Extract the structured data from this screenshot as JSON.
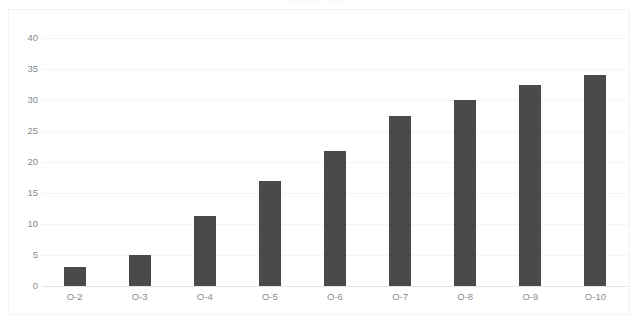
{
  "chart_data": {
    "type": "bar",
    "title": "Chart Title",
    "xlabel": "",
    "ylabel": "",
    "categories": [
      "O-2",
      "O-3",
      "O-4",
      "O-5",
      "O-6",
      "O-7",
      "O-8",
      "O-9",
      "O-10"
    ],
    "values": [
      3,
      5,
      11.3,
      17,
      21.8,
      27.5,
      30,
      32.5,
      34
    ],
    "ylim": [
      0,
      40
    ],
    "yticks": [
      0,
      5,
      10,
      15,
      20,
      25,
      30,
      35,
      40
    ],
    "ytick_labels": [
      "0",
      "5",
      "10",
      "15",
      "20",
      "25",
      "30",
      "35",
      "40"
    ],
    "grid": true,
    "legend": false,
    "legend_position": "none",
    "series": [
      {
        "name": "Series 1",
        "color": "#4a4a4a",
        "values": [
          3,
          5,
          11.3,
          17,
          21.8,
          27.5,
          30,
          32.5,
          34
        ]
      }
    ]
  },
  "colors": {
    "bar": "#4a4a4a",
    "gridline": "#f4f4f5",
    "baseline": "#e4e4e6",
    "tick_label": "#8a8a8f",
    "background": "#ffffff",
    "frame": "#f2f2f4"
  }
}
